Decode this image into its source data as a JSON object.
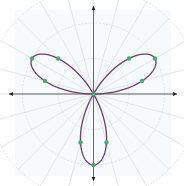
{
  "chart_data": {
    "type": "line",
    "subtype": "polar",
    "title": "",
    "equation": "r = sin(3θ)",
    "xlabel": "",
    "ylabel": "",
    "r_range": [
      0,
      1
    ],
    "grid": true,
    "grid_circles": [
      0.5,
      1.0,
      1.5
    ],
    "radial_line_step_deg": 15,
    "legend": null,
    "series": [
      {
        "name": "rose curve",
        "color": "#6b3b6e",
        "function": "sin(3*theta)",
        "theta_range_deg": [
          0,
          180
        ],
        "samples": 361
      }
    ],
    "marked_points": {
      "color": "#4caa6c",
      "points": [
        {
          "theta_deg": 0,
          "r": 0
        },
        {
          "theta_deg": 15,
          "r": 0.707
        },
        {
          "theta_deg": 30,
          "r": 1.0
        },
        {
          "theta_deg": 45,
          "r": 0.707
        },
        {
          "theta_deg": 135,
          "r": 0.707
        },
        {
          "theta_deg": 150,
          "r": 1.0
        },
        {
          "theta_deg": 165,
          "r": 0.707
        },
        {
          "theta_deg": 255,
          "r": 0.707
        },
        {
          "theta_deg": 270,
          "r": 1.0
        },
        {
          "theta_deg": 285,
          "r": 0.707
        }
      ]
    }
  },
  "layout": {
    "center": [
      93.5,
      94
    ],
    "unit_px": 71,
    "axis_color": "#555555",
    "grid_color": "#d6dbe0",
    "plot_bg": "#f7fafc"
  }
}
